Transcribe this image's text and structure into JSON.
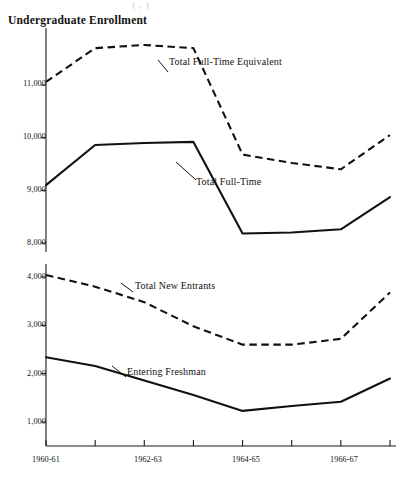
{
  "figure": {
    "title": "Undergraduate Enrollment",
    "faint_top_text": "( , )"
  },
  "labels": {
    "series_full_time_equivalent": "Total Full-Time Equivalent",
    "series_full_time": "Total Full-Time",
    "series_new_entrants": "Total New Entrants",
    "series_entering_freshman": "Entering Freshman"
  },
  "axis": {
    "upper_y_ticks": [
      "11,000",
      "10,000",
      "9,000",
      "8,000"
    ],
    "lower_y_ticks": [
      "4,000",
      "3,000",
      "2,000",
      "1,000"
    ],
    "x_ticks": [
      "1960-61",
      "1962-63",
      "1964-65",
      "1966-67"
    ]
  },
  "chart_data": [
    {
      "type": "line",
      "title": "Undergraduate Enrollment",
      "panel": "upper",
      "xlabel": "",
      "ylabel": "",
      "x": [
        "1960-61",
        "1961-62",
        "1962-63",
        "1963-64",
        "1964-65",
        "1965-66",
        "1966-67",
        "1967-68"
      ],
      "xtick_labels": [
        "1960-61",
        "",
        "1962-63",
        "",
        "1964-65",
        "",
        "1966-67",
        ""
      ],
      "ylim": [
        8000,
        11800
      ],
      "ytick_values": [
        11000,
        10000,
        9000,
        8000
      ],
      "ytick_labels": [
        "11,000",
        "10,000",
        "9,000",
        "8,000"
      ],
      "grid": false,
      "legend": "inline-annotations",
      "series": [
        {
          "name": "Total Full-Time Equivalent",
          "style": "dashed",
          "values": [
            11060,
            11700,
            11760,
            11700,
            9680,
            9520,
            9400,
            10050
          ]
        },
        {
          "name": "Total Full-Time",
          "style": "solid",
          "values": [
            9100,
            9860,
            9900,
            9920,
            8180,
            8200,
            8260,
            8870
          ]
        }
      ]
    },
    {
      "type": "line",
      "panel": "lower",
      "xlabel": "",
      "ylabel": "",
      "x": [
        "1960-61",
        "1961-62",
        "1962-63",
        "1963-64",
        "1964-65",
        "1965-66",
        "1966-67",
        "1967-68"
      ],
      "xtick_labels": [
        "1960-61",
        "",
        "1962-63",
        "",
        "1964-65",
        "",
        "1966-67",
        ""
      ],
      "ylim": [
        1000,
        4100
      ],
      "ytick_values": [
        4000,
        3000,
        2000,
        1000
      ],
      "ytick_labels": [
        "4,000",
        "3,000",
        "2,000",
        "1,000"
      ],
      "grid": false,
      "legend": "inline-annotations",
      "series": [
        {
          "name": "Total New Entrants",
          "style": "dashed",
          "values": [
            4040,
            3800,
            3480,
            2980,
            2600,
            2600,
            2720,
            3680
          ]
        },
        {
          "name": "Entering Freshman",
          "style": "solid",
          "values": [
            2340,
            2160,
            1860,
            1560,
            1230,
            1330,
            1420,
            1900
          ]
        }
      ]
    }
  ]
}
